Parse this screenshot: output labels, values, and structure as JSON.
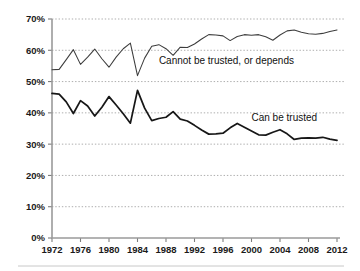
{
  "chart_data": {
    "type": "line",
    "title": "",
    "subtitle": "",
    "xlabel": "",
    "ylabel": "",
    "xlim": [
      1972,
      2012
    ],
    "ylim": [
      0,
      70
    ],
    "grid": true,
    "legend_position": "inline-annotation",
    "y_ticks": [
      "0%",
      "10%",
      "20%",
      "30%",
      "40%",
      "50%",
      "60%",
      "70%"
    ],
    "y_tick_values": [
      0,
      10,
      20,
      30,
      40,
      50,
      60,
      70
    ],
    "x_ticks": [
      "1972",
      "1976",
      "1980",
      "1984",
      "1988",
      "1992",
      "1996",
      "2000",
      "2004",
      "2008",
      "2012"
    ],
    "x_tick_values": [
      1972,
      1976,
      1980,
      1984,
      1988,
      1992,
      1996,
      2000,
      2004,
      2008,
      2012
    ],
    "x": [
      1972,
      1973,
      1974,
      1975,
      1976,
      1977,
      1978,
      1979,
      1980,
      1981,
      1982,
      1983,
      1984,
      1985,
      1986,
      1987,
      1988,
      1989,
      1990,
      1991,
      1992,
      1993,
      1994,
      1995,
      1996,
      1997,
      1998,
      1999,
      2000,
      2001,
      2002,
      2003,
      2004,
      2005,
      2006,
      2007,
      2008,
      2009,
      2010,
      2011,
      2012
    ],
    "series": [
      {
        "name": "Cannot be trusted, or depends",
        "style": "thin",
        "color": "#3d3d3d",
        "label_x": 1987,
        "label_y": 55.5,
        "values": [
          53.8,
          53.9,
          57.0,
          60.2,
          55.5,
          57.8,
          60.4,
          57.3,
          54.6,
          57.8,
          60.5,
          62.3,
          51.9,
          57.5,
          61.3,
          61.8,
          60.5,
          58.4,
          61.0,
          60.9,
          62.0,
          63.6,
          65.0,
          64.9,
          64.6,
          63.1,
          64.4,
          65.0,
          64.8,
          65.0,
          64.3,
          63.2,
          64.9,
          66.2,
          66.5,
          65.8,
          65.3,
          65.1,
          65.4,
          66.0,
          66.5
        ]
      },
      {
        "name": "Can be trusted",
        "style": "thick",
        "color": "#171717",
        "label_x": 2000,
        "label_y": 37.5,
        "values": [
          46.2,
          46.0,
          43.5,
          39.8,
          43.9,
          42.2,
          39.0,
          41.8,
          45.2,
          42.5,
          39.7,
          36.7,
          47.2,
          41.5,
          37.5,
          38.2,
          38.6,
          40.4,
          38.0,
          37.4,
          36.0,
          34.5,
          33.2,
          33.3,
          33.5,
          35.2,
          36.6,
          35.4,
          34.2,
          33.0,
          32.9,
          33.8,
          34.6,
          33.3,
          31.5,
          31.9,
          32.0,
          31.9,
          32.2,
          31.6,
          31.2
        ]
      }
    ]
  }
}
